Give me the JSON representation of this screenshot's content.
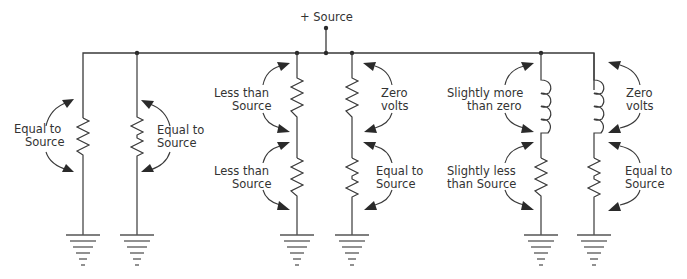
{
  "source": {
    "label": "+ Source"
  },
  "branches": [
    {
      "id": "b1",
      "components": [
        "resistor"
      ],
      "labels": {
        "left": [
          "Equal to",
          "Source"
        ]
      }
    },
    {
      "id": "b2",
      "components": [
        "resistor"
      ],
      "labels": {
        "right": [
          "Equal to",
          "Source"
        ]
      }
    },
    {
      "id": "b3",
      "components": [
        "resistor",
        "resistor"
      ],
      "labels": {
        "upper_left": [
          "Less than",
          "Source"
        ],
        "lower_left": [
          "Less than",
          "Source"
        ]
      }
    },
    {
      "id": "b4",
      "components": [
        "shorted-wire",
        "resistor"
      ],
      "labels": {
        "upper_right": [
          "Zero",
          "volts"
        ],
        "lower_right": [
          "Equal to",
          "Source"
        ]
      }
    },
    {
      "id": "b5",
      "components": [
        "inductor",
        "resistor"
      ],
      "labels": {
        "upper_left": [
          "Slightly more",
          "than zero"
        ],
        "lower_left": [
          "Slightly less",
          "than Source"
        ]
      }
    },
    {
      "id": "b6",
      "components": [
        "inductor",
        "resistor"
      ],
      "labels": {
        "upper_right": [
          "Zero",
          "volts"
        ],
        "lower_right": [
          "Equal to",
          "Source"
        ]
      }
    }
  ],
  "text": {
    "b1_l1": "Equal to",
    "b1_l2": "Source",
    "b2_l1": "Equal to",
    "b2_l2": "Source",
    "b3_u1": "Less than",
    "b3_u2": "Source",
    "b3_d1": "Less than",
    "b3_d2": "Source",
    "b4_u1": "Zero",
    "b4_u2": "volts",
    "b4_d1": "Equal to",
    "b4_d2": "Source",
    "b5_u1": "Slightly more",
    "b5_u2": "than zero",
    "b5_d1": "Slightly less",
    "b5_d2": "than Source",
    "b6_u1": "Zero",
    "b6_u2": "volts",
    "b6_d1": "Equal to",
    "b6_d2": "Source"
  }
}
